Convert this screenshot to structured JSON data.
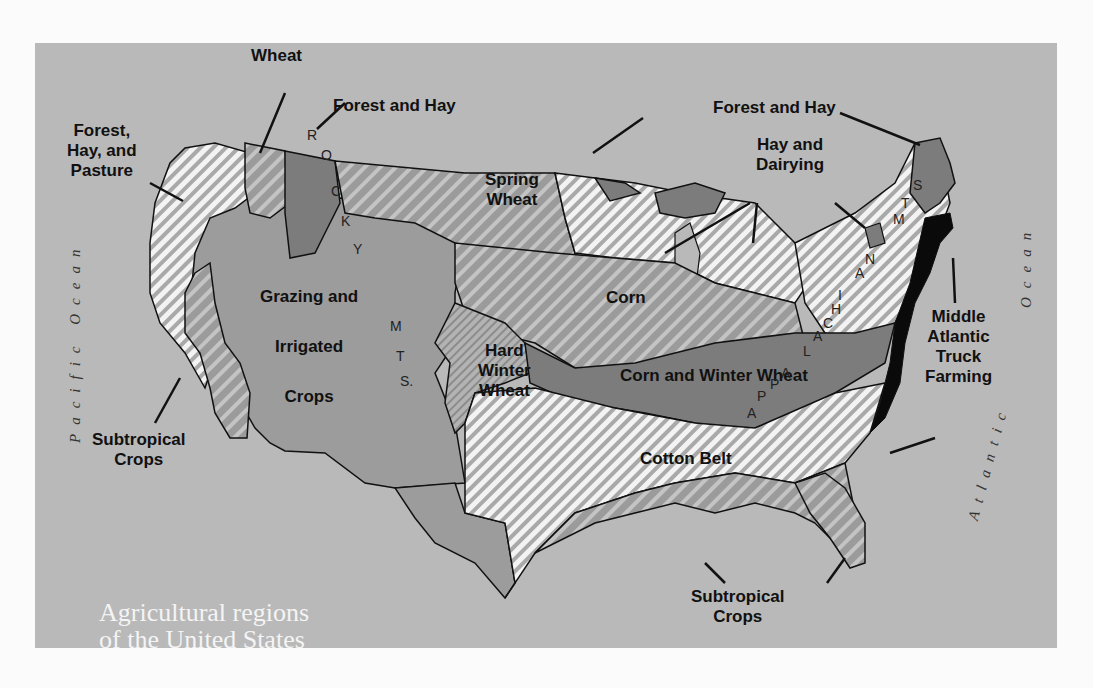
{
  "title": {
    "line1": "Agricultural regions",
    "line2": "of the United States"
  },
  "colors": {
    "page_bg": "#fbfbfb",
    "panel_bg": "#b9b9b9",
    "grazing_fill": "#9c9c9c",
    "forest_fill": "#7c7c7c",
    "truck_fill": "#0a0a0a",
    "stripe_light": "#f2f2f2",
    "stripe_dark": "#8a8a8a",
    "label_text": "#111111",
    "title_text": "#f4f4f4"
  },
  "oceans": {
    "pacific": "Pacific Ocean",
    "atlantic": "Atlantic",
    "atlantic_ocean_word": "Ocean"
  },
  "mountains": {
    "rocky": [
      "R",
      "O",
      "C",
      "K",
      "Y"
    ],
    "rocky_mts": [
      "M",
      "T",
      "S."
    ],
    "appalachian": [
      "A",
      "P",
      "P",
      "A",
      "L",
      "A",
      "C",
      "H",
      "I",
      "A",
      "N"
    ],
    "appalachian_mts": [
      "M",
      "T",
      "S"
    ]
  },
  "regions": [
    {
      "id": "wheat-nw",
      "label": "Wheat"
    },
    {
      "id": "forest-hay-nw",
      "label": "Forest and Hay"
    },
    {
      "id": "forest-hay-pasture",
      "label": "Forest,\nHay, and\nPasture"
    },
    {
      "id": "spring-wheat",
      "label": "Spring\nWheat"
    },
    {
      "id": "grazing-irrigated",
      "label": "Grazing and\nIrrigated\nCrops"
    },
    {
      "id": "subtropical-west",
      "label": "Subtropical\nCrops"
    },
    {
      "id": "corn",
      "label": "Corn"
    },
    {
      "id": "hard-winter-wheat",
      "label": "Hard\nWinter\nWheat"
    },
    {
      "id": "corn-winter-wheat",
      "label": "Corn and Winter Wheat"
    },
    {
      "id": "cotton-belt",
      "label": "Cotton Belt"
    },
    {
      "id": "subtropical-south",
      "label": "Subtropical\nCrops"
    },
    {
      "id": "forest-hay-ne",
      "label": "Forest and Hay"
    },
    {
      "id": "hay-dairying",
      "label": "Hay and\nDairying"
    },
    {
      "id": "middle-atlantic",
      "label": "Middle\nAtlantic\nTruck\nFarming"
    }
  ]
}
